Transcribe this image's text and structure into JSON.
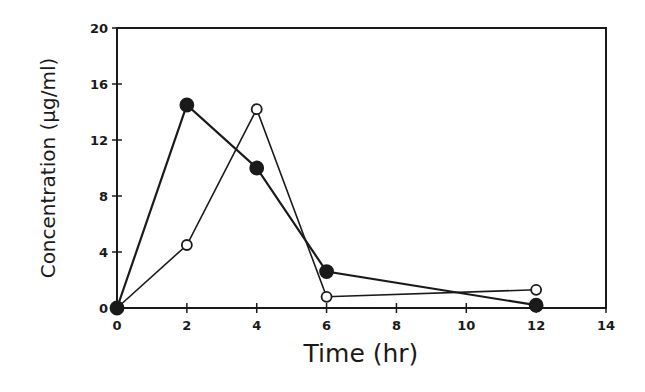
{
  "chart_data": {
    "type": "line",
    "title": "",
    "xlabel": "Time (hr)",
    "ylabel": "Concentration (µg/ml)",
    "xlim": [
      0,
      14
    ],
    "ylim": [
      0,
      20
    ],
    "x_ticks": [
      0,
      2,
      4,
      6,
      8,
      10,
      12,
      14
    ],
    "y_ticks": [
      0,
      4,
      8,
      12,
      16,
      20
    ],
    "grid": false,
    "legend": null,
    "series": [
      {
        "name": "filled circles",
        "marker": "filled-circle",
        "x": [
          0,
          2,
          4,
          6,
          12
        ],
        "values": [
          0,
          14.5,
          10.0,
          2.6,
          0.2
        ]
      },
      {
        "name": "open circles",
        "marker": "open-circle",
        "x": [
          0,
          2,
          4,
          6,
          12
        ],
        "values": [
          0,
          4.5,
          14.2,
          0.8,
          1.3
        ]
      }
    ],
    "colors": {
      "ink": "#1a1a1a",
      "background": "#ffffff"
    }
  }
}
